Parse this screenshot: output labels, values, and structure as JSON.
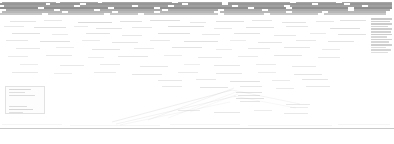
{
  "view": {
    "kind": "zoomed-out-web-page",
    "width": 394,
    "height": 144,
    "background_color": "#ffffff",
    "note": "Page rendered at extreme zoom-out; no glyph is legible at native resolution."
  },
  "palette": {
    "page_background": "#ffffff",
    "text_darkest": "#6f6f6f",
    "text_dark": "#8a8a8a",
    "text_mid": "#a8a8a8",
    "text_light": "#c6c6c6",
    "text_faintest": "#e0e0e0",
    "rule_color": "#c9c9c9",
    "block_border": "#e2e2e2",
    "block_fill": "#fdfdfd"
  },
  "header": {
    "region": {
      "x": 0,
      "y": 1,
      "width": 394,
      "height": 16
    },
    "description": "Dense full-width masthead / navigation band of unreadable text rows",
    "row_count": 7,
    "rows": [
      {
        "y": 1.5,
        "height": 1.4,
        "opacity": 0.62,
        "runs": [
          [
            2,
            54
          ],
          [
            60,
            38
          ],
          [
            102,
            70
          ],
          [
            178,
            44
          ],
          [
            228,
            62
          ],
          [
            296,
            40
          ],
          [
            342,
            50
          ]
        ]
      },
      {
        "y": 3.4,
        "height": 1.5,
        "opacity": 0.72,
        "runs": [
          [
            0,
            46
          ],
          [
            50,
            30
          ],
          [
            86,
            96
          ],
          [
            188,
            34
          ],
          [
            228,
            84
          ],
          [
            318,
            26
          ],
          [
            350,
            42
          ]
        ]
      },
      {
        "y": 5.4,
        "height": 1.4,
        "opacity": 0.66,
        "runs": [
          [
            4,
            70
          ],
          [
            80,
            52
          ],
          [
            138,
            30
          ],
          [
            174,
            58
          ],
          [
            238,
            46
          ],
          [
            290,
            72
          ],
          [
            368,
            24
          ]
        ]
      },
      {
        "y": 7.4,
        "height": 1.5,
        "opacity": 0.78,
        "runs": [
          [
            0,
            38
          ],
          [
            44,
            64
          ],
          [
            114,
            40
          ],
          [
            160,
            88
          ],
          [
            254,
            32
          ],
          [
            292,
            56
          ],
          [
            354,
            38
          ]
        ]
      },
      {
        "y": 9.4,
        "height": 1.4,
        "opacity": 0.58,
        "runs": [
          [
            6,
            48
          ],
          [
            60,
            34
          ],
          [
            100,
            62
          ],
          [
            168,
            50
          ],
          [
            224,
            38
          ],
          [
            268,
            80
          ],
          [
            354,
            36
          ]
        ]
      },
      {
        "y": 11.4,
        "height": 1.4,
        "opacity": 0.5,
        "runs": [
          [
            2,
            60
          ],
          [
            68,
            44
          ],
          [
            118,
            36
          ],
          [
            160,
            54
          ],
          [
            220,
            66
          ],
          [
            292,
            30
          ],
          [
            328,
            58
          ]
        ]
      },
      {
        "y": 13.4,
        "height": 1.3,
        "opacity": 0.38,
        "runs": [
          [
            0,
            42
          ],
          [
            48,
            56
          ],
          [
            110,
            28
          ],
          [
            144,
            74
          ],
          [
            224,
            40
          ],
          [
            270,
            48
          ],
          [
            324,
            62
          ]
        ]
      }
    ]
  },
  "body": {
    "region": {
      "x": 0,
      "y": 18,
      "width": 394,
      "height": 108
    },
    "description": "Sparse scattered text fragments across a mostly white canvas",
    "fragments": [
      {
        "x": 10,
        "y": 21,
        "w": 26,
        "h": 1.3,
        "opacity": 0.3
      },
      {
        "x": 44,
        "y": 20,
        "w": 18,
        "h": 1.2,
        "opacity": 0.26
      },
      {
        "x": 78,
        "y": 22,
        "w": 34,
        "h": 1.4,
        "opacity": 0.42
      },
      {
        "x": 120,
        "y": 21,
        "w": 22,
        "h": 1.3,
        "opacity": 0.34
      },
      {
        "x": 150,
        "y": 20,
        "w": 30,
        "h": 1.3,
        "opacity": 0.38
      },
      {
        "x": 190,
        "y": 22,
        "w": 16,
        "h": 1.2,
        "opacity": 0.28
      },
      {
        "x": 216,
        "y": 21,
        "w": 28,
        "h": 1.3,
        "opacity": 0.36
      },
      {
        "x": 252,
        "y": 20,
        "w": 20,
        "h": 1.2,
        "opacity": 0.3
      },
      {
        "x": 282,
        "y": 22,
        "w": 24,
        "h": 1.3,
        "opacity": 0.32
      },
      {
        "x": 316,
        "y": 21,
        "w": 18,
        "h": 1.2,
        "opacity": 0.28
      },
      {
        "x": 340,
        "y": 20,
        "w": 26,
        "h": 1.3,
        "opacity": 0.34
      },
      {
        "x": 4,
        "y": 26,
        "w": 20,
        "h": 1.2,
        "opacity": 0.26
      },
      {
        "x": 34,
        "y": 27,
        "w": 32,
        "h": 1.3,
        "opacity": 0.36
      },
      {
        "x": 74,
        "y": 26,
        "w": 14,
        "h": 1.2,
        "opacity": 0.24
      },
      {
        "x": 96,
        "y": 28,
        "w": 26,
        "h": 1.3,
        "opacity": 0.32
      },
      {
        "x": 132,
        "y": 27,
        "w": 20,
        "h": 1.2,
        "opacity": 0.28
      },
      {
        "x": 168,
        "y": 26,
        "w": 36,
        "h": 1.4,
        "opacity": 0.4
      },
      {
        "x": 214,
        "y": 28,
        "w": 18,
        "h": 1.2,
        "opacity": 0.26
      },
      {
        "x": 246,
        "y": 27,
        "w": 28,
        "h": 1.3,
        "opacity": 0.34
      },
      {
        "x": 286,
        "y": 26,
        "w": 22,
        "h": 1.2,
        "opacity": 0.3
      },
      {
        "x": 330,
        "y": 28,
        "w": 30,
        "h": 1.3,
        "opacity": 0.38
      },
      {
        "x": 12,
        "y": 33,
        "w": 28,
        "h": 1.3,
        "opacity": 0.34
      },
      {
        "x": 52,
        "y": 34,
        "w": 16,
        "h": 1.2,
        "opacity": 0.24
      },
      {
        "x": 86,
        "y": 33,
        "w": 24,
        "h": 1.3,
        "opacity": 0.32
      },
      {
        "x": 122,
        "y": 35,
        "w": 20,
        "h": 1.2,
        "opacity": 0.28
      },
      {
        "x": 158,
        "y": 33,
        "w": 32,
        "h": 1.3,
        "opacity": 0.36
      },
      {
        "x": 202,
        "y": 34,
        "w": 18,
        "h": 1.2,
        "opacity": 0.26
      },
      {
        "x": 234,
        "y": 33,
        "w": 26,
        "h": 1.3,
        "opacity": 0.32
      },
      {
        "x": 274,
        "y": 35,
        "w": 22,
        "h": 1.2,
        "opacity": 0.28
      },
      {
        "x": 310,
        "y": 33,
        "w": 16,
        "h": 1.2,
        "opacity": 0.24
      },
      {
        "x": 338,
        "y": 34,
        "w": 28,
        "h": 1.3,
        "opacity": 0.34
      },
      {
        "x": 6,
        "y": 40,
        "w": 22,
        "h": 1.2,
        "opacity": 0.28
      },
      {
        "x": 40,
        "y": 41,
        "w": 30,
        "h": 1.3,
        "opacity": 0.36
      },
      {
        "x": 82,
        "y": 40,
        "w": 18,
        "h": 1.2,
        "opacity": 0.24
      },
      {
        "x": 112,
        "y": 42,
        "w": 26,
        "h": 1.3,
        "opacity": 0.3
      },
      {
        "x": 150,
        "y": 40,
        "w": 20,
        "h": 1.2,
        "opacity": 0.26
      },
      {
        "x": 184,
        "y": 41,
        "w": 34,
        "h": 1.3,
        "opacity": 0.34
      },
      {
        "x": 230,
        "y": 40,
        "w": 16,
        "h": 1.2,
        "opacity": 0.22
      },
      {
        "x": 258,
        "y": 42,
        "w": 24,
        "h": 1.3,
        "opacity": 0.3
      },
      {
        "x": 296,
        "y": 40,
        "w": 20,
        "h": 1.2,
        "opacity": 0.26
      },
      {
        "x": 328,
        "y": 41,
        "w": 26,
        "h": 1.3,
        "opacity": 0.32
      },
      {
        "x": 16,
        "y": 48,
        "w": 24,
        "h": 1.2,
        "opacity": 0.26
      },
      {
        "x": 56,
        "y": 47,
        "w": 18,
        "h": 1.2,
        "opacity": 0.22
      },
      {
        "x": 92,
        "y": 49,
        "w": 28,
        "h": 1.3,
        "opacity": 0.3
      },
      {
        "x": 134,
        "y": 48,
        "w": 20,
        "h": 1.2,
        "opacity": 0.24
      },
      {
        "x": 172,
        "y": 47,
        "w": 30,
        "h": 1.3,
        "opacity": 0.32
      },
      {
        "x": 216,
        "y": 49,
        "w": 16,
        "h": 1.2,
        "opacity": 0.22
      },
      {
        "x": 248,
        "y": 48,
        "w": 22,
        "h": 1.2,
        "opacity": 0.26
      },
      {
        "x": 284,
        "y": 47,
        "w": 26,
        "h": 1.3,
        "opacity": 0.3
      },
      {
        "x": 322,
        "y": 49,
        "w": 18,
        "h": 1.2,
        "opacity": 0.24
      },
      {
        "x": 8,
        "y": 56,
        "w": 20,
        "h": 1.2,
        "opacity": 0.24
      },
      {
        "x": 46,
        "y": 55,
        "w": 26,
        "h": 1.3,
        "opacity": 0.28
      },
      {
        "x": 88,
        "y": 57,
        "w": 16,
        "h": 1.2,
        "opacity": 0.22
      },
      {
        "x": 118,
        "y": 56,
        "w": 30,
        "h": 1.3,
        "opacity": 0.3
      },
      {
        "x": 164,
        "y": 55,
        "w": 18,
        "h": 1.2,
        "opacity": 0.22
      },
      {
        "x": 198,
        "y": 57,
        "w": 24,
        "h": 1.2,
        "opacity": 0.26
      },
      {
        "x": 238,
        "y": 56,
        "w": 20,
        "h": 1.2,
        "opacity": 0.24
      },
      {
        "x": 274,
        "y": 55,
        "w": 28,
        "h": 1.3,
        "opacity": 0.3
      },
      {
        "x": 318,
        "y": 57,
        "w": 22,
        "h": 1.2,
        "opacity": 0.26
      },
      {
        "x": 20,
        "y": 64,
        "w": 18,
        "h": 1.2,
        "opacity": 0.22
      },
      {
        "x": 60,
        "y": 65,
        "w": 24,
        "h": 1.2,
        "opacity": 0.26
      },
      {
        "x": 100,
        "y": 64,
        "w": 20,
        "h": 1.2,
        "opacity": 0.24
      },
      {
        "x": 140,
        "y": 66,
        "w": 28,
        "h": 1.3,
        "opacity": 0.28
      },
      {
        "x": 184,
        "y": 64,
        "w": 16,
        "h": 1.2,
        "opacity": 0.2
      },
      {
        "x": 214,
        "y": 65,
        "w": 26,
        "h": 1.3,
        "opacity": 0.28
      },
      {
        "x": 256,
        "y": 64,
        "w": 20,
        "h": 1.2,
        "opacity": 0.24
      },
      {
        "x": 292,
        "y": 66,
        "w": 24,
        "h": 1.2,
        "opacity": 0.26
      },
      {
        "x": 12,
        "y": 72,
        "w": 26,
        "h": 1.3,
        "opacity": 0.26
      },
      {
        "x": 54,
        "y": 73,
        "w": 18,
        "h": 1.2,
        "opacity": 0.22
      },
      {
        "x": 94,
        "y": 72,
        "w": 22,
        "h": 1.2,
        "opacity": 0.24
      },
      {
        "x": 132,
        "y": 74,
        "w": 30,
        "h": 1.3,
        "opacity": 0.3
      },
      {
        "x": 178,
        "y": 72,
        "w": 20,
        "h": 1.2,
        "opacity": 0.24
      },
      {
        "x": 216,
        "y": 73,
        "w": 26,
        "h": 1.3,
        "opacity": 0.28
      },
      {
        "x": 258,
        "y": 72,
        "w": 18,
        "h": 1.2,
        "opacity": 0.22
      },
      {
        "x": 294,
        "y": 74,
        "w": 28,
        "h": 1.3,
        "opacity": 0.3
      },
      {
        "x": 158,
        "y": 80,
        "w": 24,
        "h": 1.2,
        "opacity": 0.28
      },
      {
        "x": 196,
        "y": 79,
        "w": 20,
        "h": 1.2,
        "opacity": 0.26
      },
      {
        "x": 230,
        "y": 81,
        "w": 30,
        "h": 1.3,
        "opacity": 0.34
      },
      {
        "x": 272,
        "y": 80,
        "w": 18,
        "h": 1.2,
        "opacity": 0.24
      },
      {
        "x": 302,
        "y": 79,
        "w": 26,
        "h": 1.3,
        "opacity": 0.3
      },
      {
        "x": 162,
        "y": 86,
        "w": 20,
        "h": 1.2,
        "opacity": 0.26
      },
      {
        "x": 200,
        "y": 87,
        "w": 28,
        "h": 1.3,
        "opacity": 0.32
      },
      {
        "x": 240,
        "y": 86,
        "w": 22,
        "h": 1.2,
        "opacity": 0.28
      },
      {
        "x": 276,
        "y": 88,
        "w": 18,
        "h": 1.2,
        "opacity": 0.24
      },
      {
        "x": 306,
        "y": 86,
        "w": 24,
        "h": 1.2,
        "opacity": 0.28
      },
      {
        "x": 236,
        "y": 92,
        "w": 26,
        "h": 1.3,
        "opacity": 0.34
      },
      {
        "x": 238,
        "y": 95,
        "w": 22,
        "h": 1.2,
        "opacity": 0.32
      },
      {
        "x": 236,
        "y": 98,
        "w": 28,
        "h": 1.3,
        "opacity": 0.36
      },
      {
        "x": 240,
        "y": 101,
        "w": 20,
        "h": 1.2,
        "opacity": 0.3
      },
      {
        "x": 286,
        "y": 104,
        "w": 24,
        "h": 1.2,
        "opacity": 0.26
      },
      {
        "x": 290,
        "y": 107,
        "w": 18,
        "h": 1.2,
        "opacity": 0.22
      },
      {
        "x": 178,
        "y": 110,
        "w": 22,
        "h": 1.2,
        "opacity": 0.24
      },
      {
        "x": 214,
        "y": 112,
        "w": 26,
        "h": 1.3,
        "opacity": 0.28
      },
      {
        "x": 254,
        "y": 110,
        "w": 18,
        "h": 1.2,
        "opacity": 0.22
      },
      {
        "x": 284,
        "y": 113,
        "w": 24,
        "h": 1.2,
        "opacity": 0.26
      }
    ]
  },
  "left_block": {
    "region": {
      "x": 5,
      "y": 86,
      "width": 40,
      "height": 28
    },
    "description": "Faint bordered panel in lower-left",
    "rows": [
      {
        "x": 3,
        "y": 2,
        "w": 22,
        "h": 1.2,
        "opacity": 0.32
      },
      {
        "x": 3,
        "y": 5,
        "w": 16,
        "h": 1.2,
        "opacity": 0.26
      },
      {
        "x": 3,
        "y": 8,
        "w": 26,
        "h": 1.2,
        "opacity": 0.28
      },
      {
        "x": 3,
        "y": 19,
        "w": 18,
        "h": 1.2,
        "opacity": 0.28
      },
      {
        "x": 3,
        "y": 22,
        "w": 24,
        "h": 1.2,
        "opacity": 0.34
      },
      {
        "x": 3,
        "y": 25,
        "w": 14,
        "h": 1.2,
        "opacity": 0.24
      }
    ]
  },
  "right_rail": {
    "region": {
      "x": 371,
      "y": 18,
      "width": 22,
      "height": 58
    },
    "description": "Vertical stack of short list rows pinned to the right edge",
    "row_height": 1.5,
    "row_gap": 2.6,
    "rows": [
      {
        "w": 21,
        "opacity": 0.46
      },
      {
        "w": 19,
        "opacity": 0.4
      },
      {
        "w": 21,
        "opacity": 0.44
      },
      {
        "w": 17,
        "opacity": 0.36
      },
      {
        "w": 21,
        "opacity": 0.42
      },
      {
        "w": 20,
        "opacity": 0.38
      },
      {
        "w": 21,
        "opacity": 0.44
      },
      {
        "w": 16,
        "opacity": 0.32
      },
      {
        "w": 21,
        "opacity": 0.4
      },
      {
        "w": 18,
        "opacity": 0.34
      },
      {
        "w": 21,
        "opacity": 0.42
      },
      {
        "w": 15,
        "opacity": 0.3
      },
      {
        "w": 20,
        "opacity": 0.36
      },
      {
        "w": 17,
        "opacity": 0.28
      }
    ],
    "trailing_rows": [
      {
        "y": 64,
        "w": 14,
        "opacity": 0.26
      },
      {
        "y": 67,
        "w": 18,
        "opacity": 0.3
      },
      {
        "y": 70,
        "w": 12,
        "opacity": 0.22
      }
    ]
  },
  "diagram": {
    "region": {
      "x": 110,
      "y": 84,
      "width": 130,
      "height": 44
    },
    "description": "Faint converging diagonal connector strokes in lower-middle",
    "stroke_color": "#b4b4b4",
    "lines": [
      {
        "x1": 112,
        "y1": 122,
        "x2": 232,
        "y2": 90,
        "opacity": 0.4,
        "width": 0.55
      },
      {
        "x1": 116,
        "y1": 124,
        "x2": 236,
        "y2": 96,
        "opacity": 0.32,
        "width": 0.5
      },
      {
        "x1": 120,
        "y1": 125,
        "x2": 230,
        "y2": 102,
        "opacity": 0.26,
        "width": 0.45
      },
      {
        "x1": 148,
        "y1": 120,
        "x2": 234,
        "y2": 88,
        "opacity": 0.3,
        "width": 0.5
      },
      {
        "x1": 168,
        "y1": 118,
        "x2": 236,
        "y2": 92,
        "opacity": 0.24,
        "width": 0.45
      },
      {
        "x1": 190,
        "y1": 112,
        "x2": 238,
        "y2": 94,
        "opacity": 0.22,
        "width": 0.4
      },
      {
        "x1": 232,
        "y1": 90,
        "x2": 300,
        "y2": 104,
        "opacity": 0.28,
        "width": 0.5
      },
      {
        "x1": 234,
        "y1": 96,
        "x2": 296,
        "y2": 108,
        "opacity": 0.22,
        "width": 0.45
      }
    ]
  },
  "footer": {
    "rule": {
      "x": 0,
      "y": 128,
      "width": 394,
      "height": 0.5,
      "color": "#c9c9c9"
    },
    "description": "Thin full-width horizontal rule with blank margin beneath",
    "below_rule_rows": [
      {
        "x": 2,
        "y": 124,
        "w": 60,
        "h": 1.1,
        "opacity": 0.18
      },
      {
        "x": 70,
        "y": 125,
        "w": 90,
        "h": 1.1,
        "opacity": 0.16
      },
      {
        "x": 170,
        "y": 124,
        "w": 70,
        "h": 1.1,
        "opacity": 0.18
      },
      {
        "x": 248,
        "y": 125,
        "w": 84,
        "h": 1.1,
        "opacity": 0.16
      },
      {
        "x": 338,
        "y": 124,
        "w": 52,
        "h": 1.1,
        "opacity": 0.18
      }
    ]
  }
}
